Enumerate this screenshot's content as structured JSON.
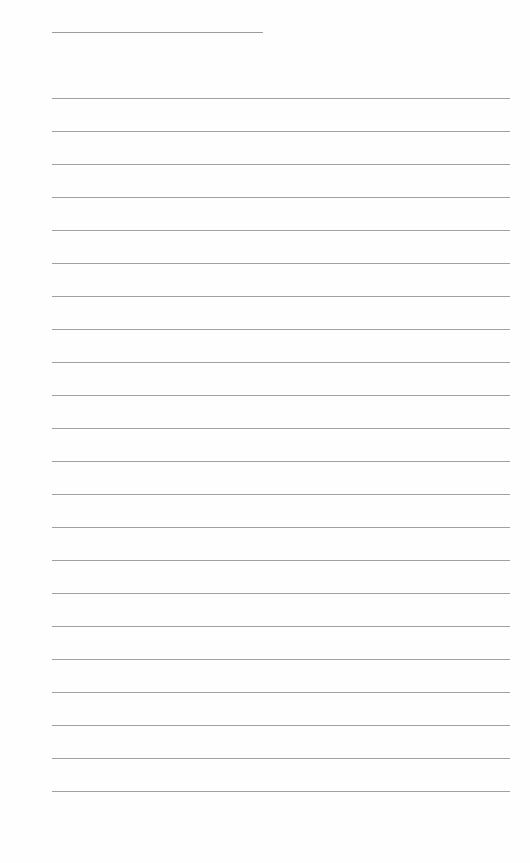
{
  "page": {
    "type": "lined-notebook-page",
    "title_line": {
      "x": 52,
      "y": 32,
      "width": 211
    },
    "ruled_lines": {
      "count": 22,
      "start_y": 98,
      "spacing": 33,
      "x": 52,
      "width": 458,
      "color": "#a0a0a0"
    },
    "content": []
  }
}
